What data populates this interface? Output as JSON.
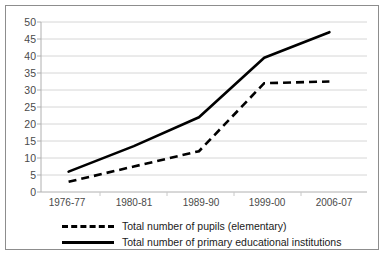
{
  "chart_data": {
    "type": "line",
    "title": "",
    "subtitle": "",
    "xlabel": "",
    "ylabel": "",
    "categories": [
      "1976-77",
      "1980-81",
      "1989-90",
      "1999-00",
      "2006-07"
    ],
    "ylim": [
      0,
      50
    ],
    "ytick_labels": [
      "0",
      "5",
      "10",
      "15",
      "20",
      "25",
      "30",
      "35",
      "40",
      "45",
      "50"
    ],
    "ytick_values": [
      0,
      5,
      10,
      15,
      20,
      25,
      30,
      35,
      40,
      45,
      50
    ],
    "grid": "horizontal",
    "legend_position": "bottom",
    "series": [
      {
        "name": "Total number of pupils (elementary)",
        "style": "dashed",
        "color": "#000000",
        "values": [
          3,
          7.5,
          12,
          32,
          32.5
        ]
      },
      {
        "name": "Total number of primary educational institutions",
        "style": "solid",
        "color": "#000000",
        "values": [
          6,
          13.5,
          22,
          39.5,
          47
        ]
      }
    ]
  },
  "legend": {
    "items": [
      {
        "label": "Total number of pupils (elementary)",
        "swatch": "dashed-line-swatch"
      },
      {
        "label": "Total number of primary educational institutions",
        "swatch": "solid-line-swatch"
      }
    ]
  },
  "axes": {
    "y_labels": [
      "50",
      "45",
      "40",
      "35",
      "30",
      "25",
      "20",
      "15",
      "10",
      "5",
      "0"
    ],
    "x_labels": [
      "1976-77",
      "1980-81",
      "1989-90",
      "1999-00",
      "2006-07"
    ]
  },
  "colors": {
    "frame": "#8d8d8d",
    "gridline": "#d6d6d6",
    "axis": "#b0b0b0",
    "series": "#000000",
    "tick_text": "#4a4a4a",
    "legend_text": "#1a1a1a",
    "background": "#ffffff"
  }
}
